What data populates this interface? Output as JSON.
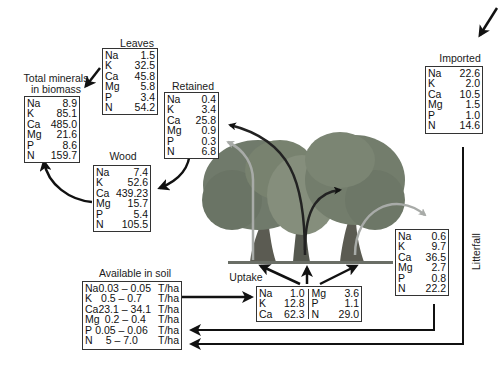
{
  "diagram": {
    "type": "mineral cycling in forest",
    "boxes": {
      "leaves": {
        "title": "Leaves",
        "rows": [
          {
            "el": "Na",
            "val": "1.5"
          },
          {
            "el": "K",
            "val": "32.5"
          },
          {
            "el": "Ca",
            "val": "45.8"
          },
          {
            "el": "Mg",
            "val": "5.8"
          },
          {
            "el": "P",
            "val": "3.4"
          },
          {
            "el": "N",
            "val": "54.2"
          }
        ]
      },
      "total": {
        "title_line1": "Total minerals",
        "title_line2": "in biomass",
        "rows": [
          {
            "el": "Na",
            "val": "8.9"
          },
          {
            "el": "K",
            "val": "85.1"
          },
          {
            "el": "Ca",
            "val": "485.0"
          },
          {
            "el": "Mg",
            "val": "21.6"
          },
          {
            "el": "P",
            "val": "8.6"
          },
          {
            "el": "N",
            "val": "159.7"
          }
        ]
      },
      "retained": {
        "title": "Retained",
        "rows": [
          {
            "el": "Na",
            "val": "0.4"
          },
          {
            "el": "K",
            "val": "3.4"
          },
          {
            "el": "Ca",
            "val": "25.8"
          },
          {
            "el": "Mg",
            "val": "0.9"
          },
          {
            "el": "P",
            "val": "0.3"
          },
          {
            "el": "N",
            "val": "6.8"
          }
        ]
      },
      "wood": {
        "title": "Wood",
        "rows": [
          {
            "el": "Na",
            "val": "7.4"
          },
          {
            "el": "K",
            "val": "52.6"
          },
          {
            "el": "Ca",
            "val": "439.23"
          },
          {
            "el": "Mg",
            "val": "15.7"
          },
          {
            "el": "P",
            "val": "5.4"
          },
          {
            "el": "N",
            "val": "105.5"
          }
        ]
      },
      "imported": {
        "title": "Imported",
        "rows": [
          {
            "el": "Na",
            "val": "22.6"
          },
          {
            "el": "K",
            "val": "2.0"
          },
          {
            "el": "Ca",
            "val": "10.5"
          },
          {
            "el": "Mg",
            "val": "1.5"
          },
          {
            "el": "P",
            "val": "1.0"
          },
          {
            "el": "N",
            "val": "14.6"
          }
        ]
      },
      "litter": {
        "rows": [
          {
            "el": "Na",
            "val": "0.6"
          },
          {
            "el": "K",
            "val": "9.7"
          },
          {
            "el": "Ca",
            "val": "36.5"
          },
          {
            "el": "Mg",
            "val": "2.7"
          },
          {
            "el": "P",
            "val": "0.8"
          },
          {
            "el": "N",
            "val": "22.2"
          }
        ]
      },
      "soil": {
        "title": "Available in soil",
        "rows": [
          {
            "el": "Na",
            "val": "0.03 – 0.05",
            "unit": "T/ha"
          },
          {
            "el": "K",
            "val": "0.5 – 0.7",
            "unit": "T/ha"
          },
          {
            "el": "Ca",
            "val": "23.1 – 34.1",
            "unit": "T/ha"
          },
          {
            "el": "Mg",
            "val": "0.2 – 0.4",
            "unit": "T/ha"
          },
          {
            "el": "P",
            "val": "0.05 – 0.06",
            "unit": "T/ha"
          },
          {
            "el": "N",
            "val": "5 – 7.0",
            "unit": "T/ha"
          }
        ]
      },
      "uptake": {
        "title": "Uptake",
        "left": [
          {
            "el": "Na",
            "val": "1.0"
          },
          {
            "el": "K",
            "val": "12.8"
          },
          {
            "el": "Ca",
            "val": "62.3"
          }
        ],
        "right": [
          {
            "el": "Mg",
            "val": "3.6"
          },
          {
            "el": "P",
            "val": "1.1"
          },
          {
            "el": "N",
            "val": "29.0"
          }
        ]
      }
    },
    "labels": {
      "litterfall": "Litterfall"
    },
    "colors": {
      "arrow_dark": "#111111",
      "arrow_light": "#a8aba8",
      "tree_foliage": "#6f7a6a",
      "tree_trunk": "#5b5b52",
      "ground": "#6a6e66"
    }
  }
}
